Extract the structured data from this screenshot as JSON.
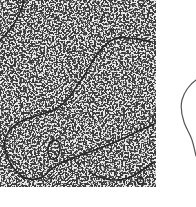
{
  "figure": {
    "panels": [
      {
        "id": "micrograph",
        "description": "electron micrograph of DNA strands on speckled background",
        "background_color": "#e4e4e4",
        "strand_color": "#2a2a2a"
      },
      {
        "id": "tracing",
        "description": "partial line tracing of molecule outline",
        "line_color": "#555555"
      }
    ],
    "text": []
  }
}
